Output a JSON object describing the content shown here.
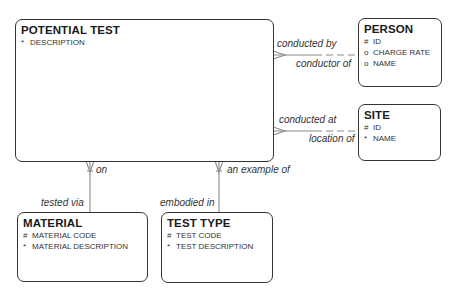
{
  "entities": [
    {
      "name": "POTENTIAL TEST",
      "attributes": [
        {
          "mark": "*",
          "label": "DESCRIPTION"
        }
      ]
    },
    {
      "name": "PERSON",
      "attributes": [
        {
          "mark": "#",
          "label": "ID"
        },
        {
          "mark": "o",
          "label": "CHARGE RATE"
        },
        {
          "mark": "o",
          "label": "NAME"
        }
      ]
    },
    {
      "name": "SITE",
      "attributes": [
        {
          "mark": "#",
          "label": "ID"
        },
        {
          "mark": "*",
          "label": "NAME"
        }
      ]
    },
    {
      "name": "MATERIAL",
      "attributes": [
        {
          "mark": "#",
          "label": "MATERIAL CODE"
        },
        {
          "mark": "*",
          "label": "MATERIAL DESCRIPTION"
        }
      ]
    },
    {
      "name": "TEST TYPE",
      "attributes": [
        {
          "mark": "#",
          "label": "TEST CODE"
        },
        {
          "mark": "*",
          "label": "TEST DESCRIPTION"
        }
      ]
    }
  ],
  "relationships": [
    {
      "from_label": "conducted by",
      "to_label": "conductor of"
    },
    {
      "from_label": "conducted at",
      "to_label": "location of"
    },
    {
      "from_label": "on",
      "to_label": "tested via"
    },
    {
      "from_label": "an example of",
      "to_label": "embodied in"
    }
  ],
  "colors": {
    "line": "#888888",
    "border": "#333333"
  }
}
